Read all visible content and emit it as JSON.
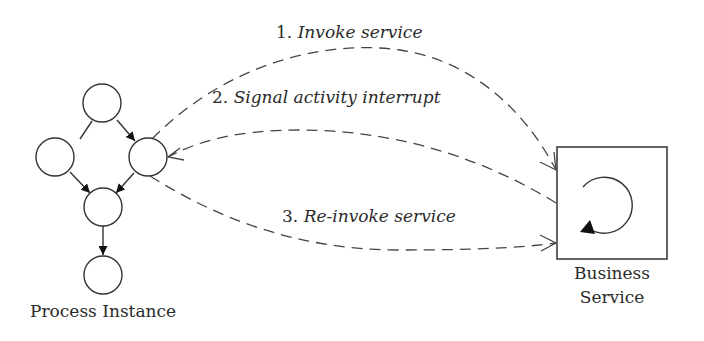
{
  "diagram": {
    "process_instance": {
      "label": "Process Instance",
      "nodes": [
        "top",
        "left",
        "right",
        "middle",
        "bottom"
      ]
    },
    "business_service": {
      "label_line1": "Business",
      "label_line2": "Service",
      "icon": "cycle-arrow-icon"
    },
    "messages": [
      {
        "num": "1.",
        "text": "Invoke service",
        "direction": "process-to-service"
      },
      {
        "num": "2.",
        "text": "Signal activity interrupt",
        "direction": "service-to-process"
      },
      {
        "num": "3.",
        "text": "Re-invoke service",
        "direction": "process-to-service"
      }
    ],
    "colors": {
      "stroke": "#333333",
      "text": "#2a2a2a",
      "background": "#ffffff"
    }
  }
}
